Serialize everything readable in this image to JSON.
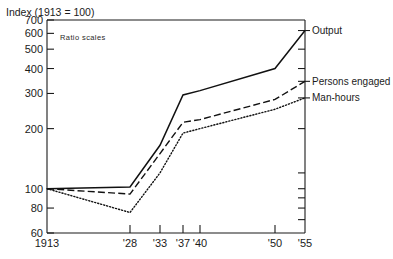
{
  "chart_data": {
    "type": "line",
    "title": "Index (1913 = 100)",
    "subtitle": "Ratio scales",
    "xlabel": "",
    "ylabel": "Index (1913 = 100)",
    "scale": "log",
    "grid": false,
    "legend_position": "right-inline",
    "x": [
      "1913",
      "'28",
      "'33",
      "'37",
      "'40",
      "'50",
      "'55"
    ],
    "x_tick_labels": [
      "1913",
      "'28",
      "'33",
      "'37",
      "'40",
      "'50",
      "'55"
    ],
    "y_tick_labels": [
      "700",
      "600",
      "500",
      "400",
      "300",
      "200",
      "100",
      "80",
      "60"
    ],
    "y_tick_values": [
      700,
      600,
      500,
      400,
      300,
      200,
      100,
      80,
      60
    ],
    "ylim": [
      60,
      700
    ],
    "series": [
      {
        "name": "Output",
        "style": "solid",
        "values": [
          100,
          102,
          165,
          295,
          310,
          400,
          620
        ]
      },
      {
        "name": "Persons engaged",
        "style": "dashed",
        "values": [
          100,
          94,
          150,
          215,
          222,
          280,
          345
        ]
      },
      {
        "name": "Man-hours",
        "style": "dotted",
        "values": [
          100,
          76,
          120,
          190,
          200,
          250,
          285
        ]
      }
    ],
    "colors": {
      "line": "#111111",
      "axis": "#1b1b1b",
      "text": "#1b1b1b",
      "background": "#ffffff"
    }
  },
  "axis": {
    "title": "Index (1913 = 100)",
    "note": "Ratio scales"
  },
  "labels": {
    "output": "Output",
    "persons_engaged": "Persons engaged",
    "man_hours": "Man-hours"
  }
}
